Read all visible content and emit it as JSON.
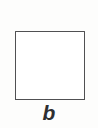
{
  "figure": {
    "background_color": "#fdfdfc",
    "panel_label": "b",
    "shapes": [
      {
        "name": "square",
        "type": "rectangle",
        "fill": "#ffffff",
        "stroke": "#3b3b3d",
        "stroke_width_px": 1.6,
        "x_px": 15,
        "y_px": 31,
        "width_px": 70,
        "height_px": 69
      }
    ],
    "label_color": "#2e2e30",
    "label_style": "italic"
  }
}
